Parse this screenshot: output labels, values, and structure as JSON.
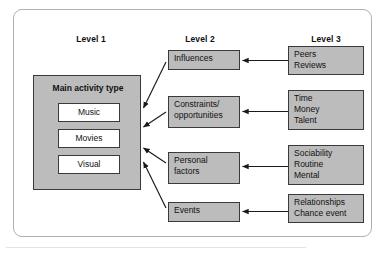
{
  "figure": {
    "type": "hierarchical-influence-diagram",
    "colors": {
      "node_fill": "#bcbcbc",
      "node_border": "#3a3a3a",
      "subnode_fill": "#ffffff",
      "frame_border": "#b0b0b0",
      "arrow": "#1a1a1a",
      "text": "#111111",
      "background": "#ffffff"
    }
  },
  "headers": {
    "level1": "Level 1",
    "level2": "Level 2",
    "level3": "Level 3"
  },
  "level1": {
    "title": "Main activity type",
    "items": [
      {
        "label": "Music"
      },
      {
        "label": "Movies"
      },
      {
        "label": "Visual"
      }
    ]
  },
  "level2": {
    "nodes": [
      {
        "id": "influences",
        "lines": [
          "Influences"
        ]
      },
      {
        "id": "constraints",
        "lines": [
          "Constraints/",
          "opportunities"
        ]
      },
      {
        "id": "personal",
        "lines": [
          "Personal",
          "factors"
        ]
      },
      {
        "id": "events",
        "lines": [
          "Events"
        ]
      }
    ]
  },
  "level3": {
    "nodes": [
      {
        "id": "peers",
        "lines": [
          "Peers",
          "Reviews"
        ]
      },
      {
        "id": "time",
        "lines": [
          "Time",
          "Money",
          "Talent"
        ]
      },
      {
        "id": "sociability",
        "lines": [
          "Sociability",
          "Routine",
          "Mental"
        ]
      },
      {
        "id": "relations",
        "lines": [
          "Relationships",
          "Chance event"
        ]
      }
    ]
  },
  "arrows": {
    "level3_to_level2": [
      {
        "from": "peers",
        "to": "influences",
        "direction": "left"
      },
      {
        "from": "time",
        "to": "constraints",
        "direction": "left"
      },
      {
        "from": "sociability",
        "to": "personal",
        "direction": "left"
      },
      {
        "from": "relations",
        "to": "events",
        "direction": "left"
      }
    ],
    "level2_to_level1": [
      {
        "from": "influences",
        "to": "main-activity-type",
        "direction": "down-left"
      },
      {
        "from": "constraints",
        "to": "main-activity-type",
        "direction": "left"
      },
      {
        "from": "personal",
        "to": "main-activity-type",
        "direction": "up-left"
      },
      {
        "from": "events",
        "to": "main-activity-type",
        "direction": "up-left"
      }
    ]
  }
}
